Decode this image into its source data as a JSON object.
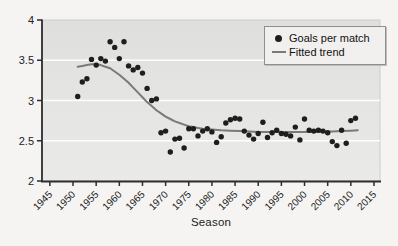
{
  "chart_data": {
    "type": "scatter",
    "title": "",
    "xlabel": "Season",
    "ylabel": "",
    "xlim": [
      1943.3,
      2016.3
    ],
    "ylim": [
      2,
      4
    ],
    "x_ticks": [
      1945,
      1950,
      1955,
      1960,
      1965,
      1970,
      1975,
      1980,
      1985,
      1990,
      1995,
      2000,
      2005,
      2010,
      2015
    ],
    "y_ticks": [
      2,
      2.5,
      3,
      3.5,
      4
    ],
    "y_gridlines": [
      2.5,
      3,
      3.5
    ],
    "grid": "horizontal-white",
    "legend": {
      "position": "top-right",
      "entries": [
        {
          "label": "Goals per match",
          "marker": "goals-dot-icon"
        },
        {
          "label": "Fitted trend",
          "marker": "trend-line-icon"
        }
      ]
    },
    "series": [
      {
        "name": "Goals per match",
        "type": "scatter",
        "x": [
          1951,
          1952,
          1953,
          1954,
          1955,
          1956,
          1957,
          1958,
          1959,
          1960,
          1961,
          1962,
          1963,
          1964,
          1965,
          1966,
          1967,
          1968,
          1969,
          1970,
          1971,
          1972,
          1973,
          1974,
          1975,
          1976,
          1977,
          1978,
          1979,
          1980,
          1981,
          1982,
          1983,
          1984,
          1985,
          1986,
          1987,
          1988,
          1989,
          1990,
          1991,
          1992,
          1993,
          1994,
          1995,
          1996,
          1997,
          1998,
          1999,
          2000,
          2001,
          2002,
          2003,
          2004,
          2005,
          2006,
          2007,
          2008,
          2009,
          2010,
          2011
        ],
        "y": [
          3.05,
          3.23,
          3.27,
          3.51,
          3.44,
          3.52,
          3.49,
          3.73,
          3.66,
          3.52,
          3.73,
          3.43,
          3.38,
          3.41,
          3.34,
          3.15,
          3.0,
          3.02,
          2.6,
          2.62,
          2.36,
          2.52,
          2.53,
          2.41,
          2.65,
          2.65,
          2.56,
          2.62,
          2.65,
          2.61,
          2.48,
          2.55,
          2.72,
          2.76,
          2.78,
          2.77,
          2.62,
          2.57,
          2.52,
          2.59,
          2.73,
          2.54,
          2.6,
          2.63,
          2.59,
          2.58,
          2.56,
          2.67,
          2.51,
          2.77,
          2.63,
          2.62,
          2.63,
          2.62,
          2.6,
          2.49,
          2.44,
          2.63,
          2.47,
          2.75,
          2.78
        ]
      },
      {
        "name": "Fitted trend",
        "type": "line",
        "points": [
          [
            1951,
            3.42
          ],
          [
            1952,
            3.43
          ],
          [
            1953,
            3.44
          ],
          [
            1954,
            3.45
          ],
          [
            1955,
            3.45
          ],
          [
            1956,
            3.44
          ],
          [
            1957,
            3.42
          ],
          [
            1958,
            3.4
          ],
          [
            1959,
            3.36
          ],
          [
            1960,
            3.32
          ],
          [
            1961,
            3.27
          ],
          [
            1962,
            3.22
          ],
          [
            1963,
            3.16
          ],
          [
            1964,
            3.1
          ],
          [
            1965,
            3.04
          ],
          [
            1966,
            2.98
          ],
          [
            1967,
            2.93
          ],
          [
            1968,
            2.88
          ],
          [
            1969,
            2.84
          ],
          [
            1970,
            2.8
          ],
          [
            1971,
            2.77
          ],
          [
            1972,
            2.74
          ],
          [
            1973,
            2.72
          ],
          [
            1974,
            2.7
          ],
          [
            1975,
            2.68
          ],
          [
            1976,
            2.67
          ],
          [
            1977,
            2.66
          ],
          [
            1978,
            2.65
          ],
          [
            1979,
            2.645
          ],
          [
            1980,
            2.64
          ],
          [
            1982,
            2.63
          ],
          [
            1984,
            2.625
          ],
          [
            1986,
            2.62
          ],
          [
            1988,
            2.615
          ],
          [
            1990,
            2.61
          ],
          [
            1992,
            2.61
          ],
          [
            1994,
            2.61
          ],
          [
            1996,
            2.61
          ],
          [
            1998,
            2.61
          ],
          [
            2000,
            2.61
          ],
          [
            2002,
            2.61
          ],
          [
            2004,
            2.612
          ],
          [
            2006,
            2.615
          ],
          [
            2008,
            2.62
          ],
          [
            2010,
            2.625
          ],
          [
            2011.5,
            2.63
          ]
        ]
      }
    ],
    "colors": {
      "point": "#1e1e1e",
      "trend": "#7d7974",
      "plot_bg_top": "#dfdfdd",
      "plot_bg_bottom": "#eaeae8",
      "gridline": "#ffffff",
      "axis": "#2e2e2e",
      "tick_label": "#222222",
      "page_bg": "#f5f4f2",
      "legend_bg": "#f1f0ee",
      "legend_border": "#8f8f8d"
    }
  }
}
